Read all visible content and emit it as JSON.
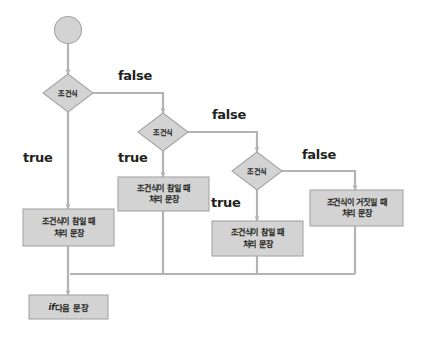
{
  "diagram": {
    "type": "flowchart",
    "background_color": "#ffffff",
    "node_fill_color": "#d3d3d3",
    "node_stroke_color": "#a6a6a6",
    "connector_color": "#b3b3b3",
    "text_color": "#231f20"
  },
  "nodes": {
    "start": {
      "shape": "circle",
      "label": ""
    },
    "decision1": {
      "shape": "diamond",
      "label": "조건식"
    },
    "decision2": {
      "shape": "diamond",
      "label": "조건식"
    },
    "decision3": {
      "shape": "diamond",
      "label": "조건식"
    },
    "process_true1": {
      "shape": "rectangle",
      "line1": "조건식이 참일 때",
      "line2": "처리 문장"
    },
    "process_true2": {
      "shape": "rectangle",
      "line1": "조건식이 참일 때",
      "line2": "처리 문장"
    },
    "process_true3": {
      "shape": "rectangle",
      "line1": "조건식이 참일 때",
      "line2": "처리 문장"
    },
    "process_false": {
      "shape": "rectangle",
      "line1": "조건식이 거짓일 때",
      "line2": "처리 문장"
    },
    "end_statement": {
      "shape": "rectangle",
      "keyword": "if",
      "label": " 다음 문장"
    }
  },
  "edge_labels": {
    "false1": "false",
    "false2": "false",
    "false3": "false",
    "true1": "true",
    "true2": "true",
    "true3": "true"
  }
}
